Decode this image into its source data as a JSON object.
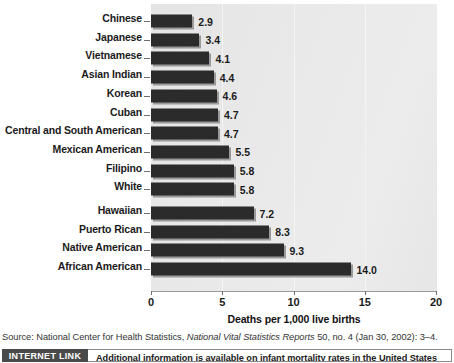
{
  "chart_data": {
    "type": "bar",
    "orientation": "horizontal",
    "title": "",
    "xlabel": "Deaths per 1,000 live births",
    "ylabel": "",
    "xlim": [
      0,
      20
    ],
    "xticks": [
      0,
      5,
      10,
      15,
      20
    ],
    "xticklabels": [
      "0",
      "5",
      "10",
      "15",
      "20"
    ],
    "grid": true,
    "grid_axis": "x",
    "legend": "none",
    "bar_color": "#2b2b2b",
    "panel_color": "#e9e9e9",
    "value_label_format": "one-decimal",
    "categories": [
      "Chinese",
      "Japanese",
      "Vietnamese",
      "Asian Indian",
      "Korean",
      "Cuban",
      "Central and South American",
      "Mexican American",
      "Filipino",
      "White",
      "Hawaiian",
      "Puerto Rican",
      "Native American",
      "African American"
    ],
    "values": [
      2.9,
      3.4,
      4.1,
      4.4,
      4.6,
      4.7,
      4.7,
      5.5,
      5.8,
      5.8,
      7.2,
      8.3,
      9.3,
      14.0
    ],
    "value_labels": [
      "2.9",
      "3.4",
      "4.1",
      "4.4",
      "4.6",
      "4.7",
      "4.7",
      "5.5",
      "5.8",
      "5.8",
      "7.2",
      "8.3",
      "9.3",
      "14.0"
    ],
    "group_break_after_index": 9
  },
  "axis": {
    "x_label": "Deaths per 1,000 live births",
    "tick_labels": [
      "0",
      "5",
      "10",
      "15",
      "20"
    ]
  },
  "rows": [
    {
      "label": "Chinese",
      "value": 2.9,
      "value_label": "2.9"
    },
    {
      "label": "Japanese",
      "value": 3.4,
      "value_label": "3.4"
    },
    {
      "label": "Vietnamese",
      "value": 4.1,
      "value_label": "4.1"
    },
    {
      "label": "Asian Indian",
      "value": 4.4,
      "value_label": "4.4"
    },
    {
      "label": "Korean",
      "value": 4.6,
      "value_label": "4.6"
    },
    {
      "label": "Cuban",
      "value": 4.7,
      "value_label": "4.7"
    },
    {
      "label": "Central and South American",
      "value": 4.7,
      "value_label": "4.7"
    },
    {
      "label": "Mexican American",
      "value": 5.5,
      "value_label": "5.5"
    },
    {
      "label": "Filipino",
      "value": 5.8,
      "value_label": "5.8"
    },
    {
      "label": "White",
      "value": 5.8,
      "value_label": "5.8"
    },
    {
      "label": "Hawaiian",
      "value": 7.2,
      "value_label": "7.2"
    },
    {
      "label": "Puerto Rican",
      "value": 8.3,
      "value_label": "8.3"
    },
    {
      "label": "Native American",
      "value": 9.3,
      "value_label": "9.3"
    },
    {
      "label": "African American",
      "value": 14.0,
      "value_label": "14.0"
    }
  ],
  "source": {
    "prefix": "Source: National Center for Health Statistics, ",
    "italic": "National Vital Statistics Reports",
    "suffix": " 50, no. 4 (Jan 30, 2002): 3–4."
  },
  "internet_link": {
    "badge_label": "INTERNET LINK",
    "text": "Additional information is available on infant mortality rates in the United States",
    "badge_color": "#4a4a4a"
  }
}
